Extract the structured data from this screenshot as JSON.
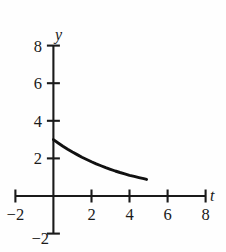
{
  "chart_data": {
    "type": "line",
    "title": "",
    "subtitle": "",
    "xlabel": "t",
    "ylabel": "y",
    "xlim": [
      -2,
      8
    ],
    "ylim": [
      -2,
      8
    ],
    "grid": false,
    "legend": false,
    "x_ticks": [
      -2,
      2,
      4,
      6,
      8
    ],
    "x_tick_labels": [
      "−2",
      "2",
      "4",
      "6",
      "8"
    ],
    "y_ticks": [
      -2,
      2,
      4,
      6,
      8
    ],
    "y_tick_labels": [
      "−2",
      "2",
      "4",
      "6",
      "8"
    ],
    "series": [
      {
        "name": "decay-curve",
        "color": "#111111",
        "x": [
          0.0,
          0.25,
          0.5,
          0.75,
          1.0,
          1.25,
          1.5,
          1.75,
          2.0,
          2.25,
          2.5,
          2.75,
          3.0,
          3.25,
          3.5,
          3.75,
          4.0,
          4.25,
          4.5,
          4.75,
          4.9
        ],
        "y": [
          3.0,
          2.82,
          2.65,
          2.49,
          2.34,
          2.2,
          2.06,
          1.94,
          1.82,
          1.71,
          1.61,
          1.51,
          1.42,
          1.33,
          1.25,
          1.18,
          1.1,
          1.04,
          0.98,
          0.92,
          0.88
        ]
      }
    ],
    "annotations": []
  },
  "axes": {
    "y_axis_label": "y",
    "x_axis_label": "t"
  },
  "colors": {
    "axis": "#1a1a1a",
    "curve": "#111111",
    "background": "#fefefe"
  }
}
